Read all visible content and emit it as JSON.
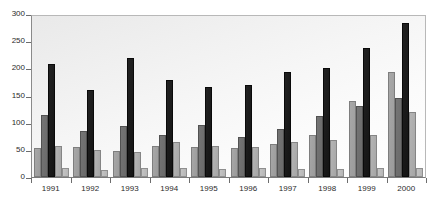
{
  "chart_data": {
    "type": "bar",
    "title": "",
    "subtitle": "",
    "xlabel": "",
    "ylabel": "",
    "ylim": [
      0,
      300
    ],
    "yticks": [
      0,
      50,
      100,
      150,
      200,
      250,
      300
    ],
    "ytick_labels": [
      "0",
      "50",
      "100",
      "150",
      "200",
      "250",
      "300"
    ],
    "grid": false,
    "legend": "none",
    "categories": [
      "1991",
      "1992",
      "1993",
      "1994",
      "1995",
      "1996",
      "1997",
      "1998",
      "1999",
      "2000"
    ],
    "series": [
      {
        "name": "Series 1",
        "color": "#a0a0a0",
        "values": [
          53,
          55,
          48,
          57,
          56,
          53,
          60,
          78,
          140,
          193
        ]
      },
      {
        "name": "Series 2",
        "color": "#6f6f6f",
        "values": [
          115,
          85,
          94,
          77,
          96,
          74,
          88,
          112,
          130,
          145
        ]
      },
      {
        "name": "Series 3",
        "color": "#1a1a1a",
        "values": [
          208,
          160,
          219,
          179,
          166,
          169,
          194,
          200,
          238,
          283
        ]
      },
      {
        "name": "Series 4",
        "color": "#adadad",
        "values": [
          58,
          49,
          46,
          64,
          57,
          55,
          64,
          68,
          78,
          120
        ]
      },
      {
        "name": "Series 5",
        "color": "#bdbdbd",
        "values": [
          17,
          12,
          16,
          17,
          14,
          16,
          14,
          15,
          17,
          17
        ]
      }
    ]
  }
}
